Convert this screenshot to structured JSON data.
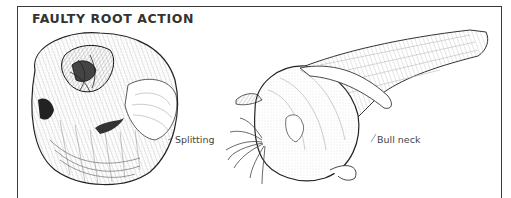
{
  "figure": {
    "title": "FAULTY ROOT ACTION",
    "labels": {
      "splitting": "Splitting",
      "bull_neck": "Bull neck"
    },
    "illustrations": [
      {
        "name": "split-onion-illustration",
        "caption_ref": "splitting"
      },
      {
        "name": "bull-neck-onion-illustration",
        "caption_ref": "bull_neck"
      }
    ],
    "colors": {
      "ink": "#333333",
      "frame": "#3a3a3a",
      "background": "#ffffff"
    }
  }
}
